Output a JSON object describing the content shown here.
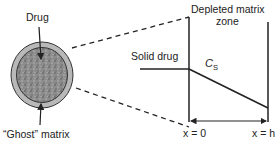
{
  "diagram": {
    "labels": {
      "drug": "Drug",
      "ghost_matrix": "“Ghost” matrix",
      "depleted_zone_line1": "Depleted matrix",
      "depleted_zone_line2": "zone",
      "solid_drug": "Solid drug",
      "cs_main": "C",
      "cs_sub": "S",
      "x0": "x = 0",
      "xh": "x = h"
    },
    "colors": {
      "line": "#222222",
      "ring": "#b5b5b5",
      "core": "#8a8a8a"
    }
  }
}
